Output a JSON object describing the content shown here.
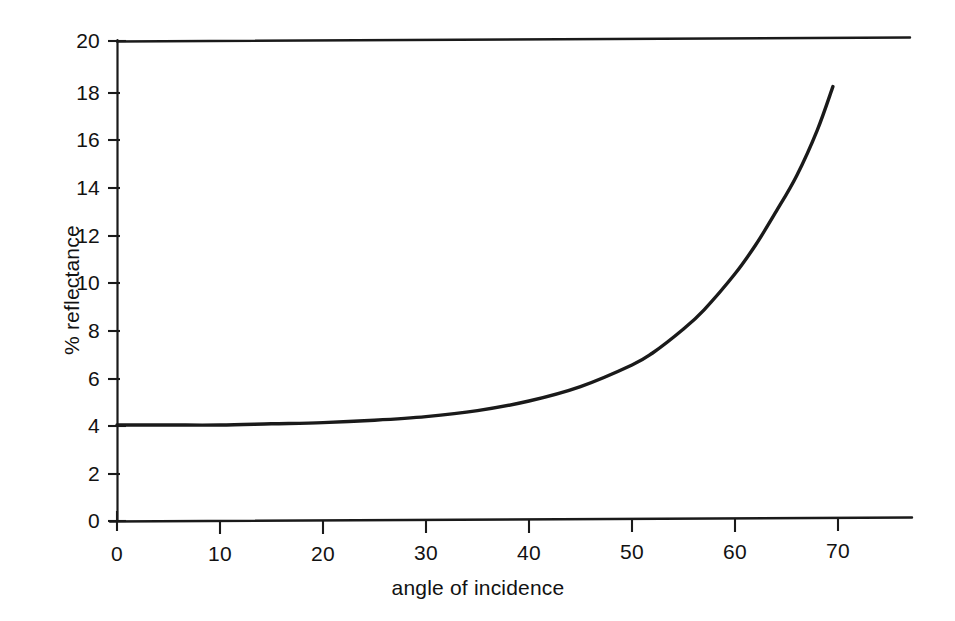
{
  "chart_data": {
    "type": "line",
    "title": "",
    "subtitle": "",
    "xlabel": "angle of incidence",
    "ylabel": "% reflectance",
    "xlim": [
      0,
      77
    ],
    "ylim": [
      0,
      20
    ],
    "xticks": [
      "0",
      "10",
      "20",
      "30",
      "40",
      "50",
      "60",
      "70"
    ],
    "xtick_values": [
      0,
      10,
      20,
      30,
      40,
      50,
      60,
      70
    ],
    "yticks": [
      "0",
      "2",
      "4",
      "6",
      "8",
      "10",
      "12",
      "14",
      "16",
      "18",
      "20"
    ],
    "ytick_values": [
      0,
      2,
      4,
      6,
      8,
      10,
      12,
      14,
      16,
      18,
      20
    ],
    "grid": false,
    "legend": null,
    "axes_style": "left-spine, bottom-spine and top-spine drawn; no right spine",
    "series": [
      {
        "name": "reflectance",
        "color": "#1a1a1a",
        "x": [
          0,
          5,
          10,
          15,
          20,
          25,
          30,
          35,
          40,
          45,
          50,
          52,
          55,
          57,
          60,
          62,
          64,
          66,
          68,
          69.5
        ],
        "values": [
          4.0,
          4.0,
          4.0,
          4.05,
          4.1,
          4.2,
          4.35,
          4.6,
          5.0,
          5.6,
          6.5,
          7.0,
          8.0,
          8.8,
          10.3,
          11.5,
          12.9,
          14.4,
          16.3,
          18.1
        ]
      }
    ]
  },
  "axis_label_x": "angle of incidence",
  "axis_label_y": "% reflectance",
  "colors": {
    "background": "#ffffff",
    "ink": "#1a1a1a",
    "curve": "#1a1a1a"
  }
}
